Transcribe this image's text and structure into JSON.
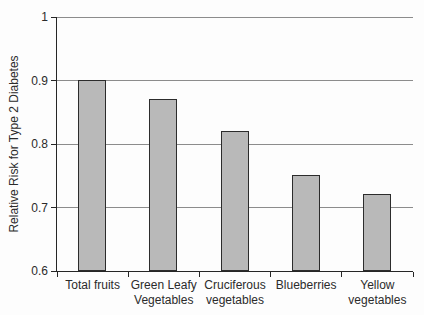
{
  "chart_data": {
    "type": "bar",
    "title": "",
    "xlabel": "",
    "ylabel": "Relative Risk for Type 2 Diabetes",
    "categories": [
      "Total fruits",
      "Green Leafy Vegetables",
      "Cruciferous vegetables",
      "Blueberries",
      "Yellow vegetables"
    ],
    "category_lines": [
      [
        "Total fruits"
      ],
      [
        "Green Leafy",
        "Vegetables"
      ],
      [
        "Cruciferous",
        "vegetables"
      ],
      [
        "Blueberries"
      ],
      [
        "Yellow",
        "vegetables"
      ]
    ],
    "values": [
      0.9,
      0.87,
      0.82,
      0.75,
      0.72
    ],
    "ylim": [
      0.6,
      1.0
    ],
    "ytick_values": [
      1,
      0.9,
      0.8,
      0.7,
      0.6
    ],
    "ytick_labels": [
      "1",
      "0.9",
      "0.8",
      "0.7",
      "0.6"
    ],
    "grid": true,
    "legend": false,
    "colors": {
      "bar_fill": "#b9b9b9",
      "bar_border": "#2c2c2c",
      "gridline": "#8c8c8c",
      "axis": "#262626",
      "text": "#2b2b2b",
      "background": "#fdfdfd"
    }
  }
}
